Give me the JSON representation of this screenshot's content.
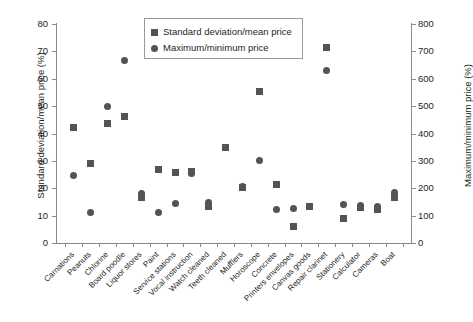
{
  "chart_data": {
    "type": "scatter",
    "title": "",
    "xlabel": "",
    "ylabel": "Standard deviation/mean price (%)",
    "ylabel_secondary": "Maximum/minimum price (%)",
    "ylim": [
      0,
      80
    ],
    "ylim_secondary": [
      0,
      800
    ],
    "yticks": [
      0,
      10,
      20,
      30,
      40,
      50,
      60,
      70,
      80
    ],
    "yticks_secondary": [
      0,
      100,
      200,
      300,
      400,
      500,
      600,
      700,
      800
    ],
    "grid": false,
    "legend_position": "top-center",
    "marker_color": "#545454",
    "categories": [
      "Carnations",
      "Peanuts",
      "Chlorine",
      "Board poodle",
      "Liquor stores",
      "Paint",
      "Service stations",
      "Vocal instruction",
      "Watch cleaned",
      "Teeth cleaned",
      "Mufflers",
      "Horoscope",
      "Concrete",
      "Printers envelopes",
      "Canvas goods",
      "Repair clarinet",
      "Stationery",
      "Calculator",
      "Cameras",
      "Boat"
    ],
    "series": [
      {
        "name": "Standard deviation/mean price",
        "marker": "square",
        "axis": "left",
        "values": [
          42.3,
          29.0,
          43.7,
          46.3,
          16.8,
          26.9,
          25.8,
          26.3,
          13.4,
          34.8,
          20.1,
          55.5,
          21.5,
          6.2,
          13.5,
          71.5,
          9.0,
          13.0,
          12.4,
          16.7
        ]
      },
      {
        "name": "Maximum/minimum price",
        "marker": "circle",
        "axis": "right",
        "values": [
          247,
          111,
          500,
          665,
          180,
          113,
          143,
          255,
          148,
          350,
          205,
          300,
          124,
          125,
          133,
          630,
          140,
          138,
          132,
          186
        ]
      }
    ]
  },
  "legend": {
    "entries": [
      {
        "label": "Standard deviation/mean price",
        "marker": "square"
      },
      {
        "label": "Maximum/minimum price",
        "marker": "circle"
      }
    ]
  },
  "axes": {
    "left_title": "Standard deviation/mean price (%)",
    "right_title": "Maximum/minimum price (%)",
    "left_ticks": [
      "80",
      "70",
      "60",
      "50",
      "40",
      "30",
      "20",
      "10",
      "0"
    ],
    "right_ticks": [
      "800",
      "700",
      "600",
      "500",
      "400",
      "300",
      "200",
      "100",
      "0"
    ]
  }
}
